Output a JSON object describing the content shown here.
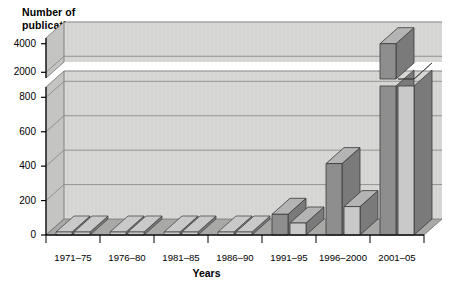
{
  "chart_data": {
    "type": "bar",
    "title": "",
    "ylabel": "Number of\npublications",
    "xlabel": "Years",
    "categories": [
      "1971–75",
      "1976–80",
      "1981–85",
      "1986–90",
      "1991–95",
      "1996–2000",
      "2001–05"
    ],
    "series": [
      {
        "name": "back-series",
        "color": "#8e8e8e",
        "values": [
          0,
          0,
          0,
          0,
          120,
          415,
          4000
        ]
      },
      {
        "name": "front-series",
        "color": "#c9c9c9",
        "values": [
          0,
          0,
          0,
          0,
          70,
          165,
          2600
        ]
      }
    ],
    "axis_break": true,
    "lower_panel": {
      "ylim": [
        0,
        860
      ],
      "ticks": [
        0,
        200,
        400,
        600,
        800
      ]
    },
    "upper_panel": {
      "ylim": [
        1600,
        4400
      ],
      "ticks": [
        2000,
        4000
      ]
    },
    "grid": true,
    "legend": "none",
    "style": "3d-bar",
    "colors": {
      "plot_background": "#d8d8d6",
      "floor": "#a8a8a6",
      "wall": "#c4c4c2",
      "gridline": "#8c8c8a",
      "axis": "#000000",
      "bar_back": "#8e8e8e",
      "bar_front": "#c9c9c9",
      "bar_top": "#b4b4b4",
      "bar_side": "#7a7a7a",
      "bar_edge": "#3a3a3a"
    }
  },
  "axis": {
    "y_ticks_upper": [
      "4000",
      "2000"
    ],
    "y_ticks_lower": [
      "800",
      "600",
      "400",
      "200",
      "0"
    ],
    "y_title": "Number of\npublications",
    "x_title": "Years"
  }
}
